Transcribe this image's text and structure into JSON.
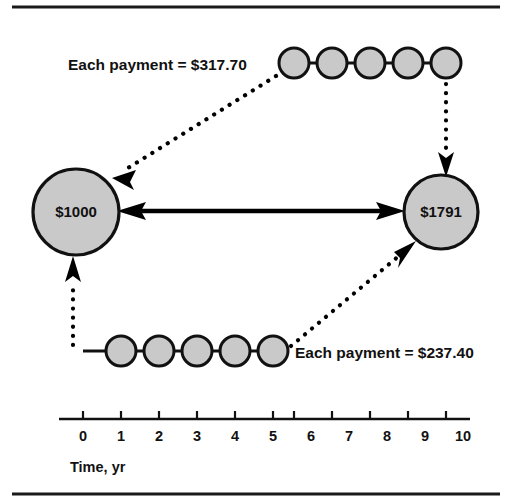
{
  "figure": {
    "background_color": "#ffffff",
    "frame": {
      "top_rule": true,
      "bottom_rule": true,
      "rule_color": "#1a1a1a"
    }
  },
  "nodes": [
    {
      "id": "present-worth",
      "label": "$1000",
      "cx": 76,
      "cy": 212,
      "r": 43,
      "fill": "#c9c9c9",
      "stroke": "#111111"
    },
    {
      "id": "future-worth",
      "label": "$1791",
      "cx": 441,
      "cy": 212,
      "r": 37,
      "fill": "#c9c9c9",
      "stroke": "#111111"
    }
  ],
  "payment_series": [
    {
      "id": "top-series",
      "label": "Each payment = $317.70",
      "amount": "$317.70",
      "years": [
        6,
        7,
        8,
        9,
        10
      ],
      "circle_radius": 15,
      "row_y": 63,
      "label_x": 68,
      "label_y": 70,
      "fill": "#c9c9c9",
      "stroke": "#111111"
    },
    {
      "id": "bottom-series",
      "label": "Each payment = $237.40",
      "amount": "$237.40",
      "years": [
        1,
        2,
        3,
        4,
        5
      ],
      "circle_radius": 15,
      "row_y": 351,
      "label_x": 295,
      "label_y": 358,
      "fill": "#c9c9c9",
      "stroke": "#111111"
    }
  ],
  "connectors": [
    {
      "id": "equivalence-arrow",
      "style": "solid-double-arrow",
      "from": "present-worth",
      "to": "future-worth",
      "color": "#000000"
    },
    {
      "id": "top-series-to-present",
      "style": "dotted-arrow",
      "from": "top-series",
      "to": "present-worth",
      "color": "#000000"
    },
    {
      "id": "top-series-to-future",
      "style": "dotted-arrow",
      "from": "top-series",
      "to": "future-worth",
      "color": "#000000"
    },
    {
      "id": "bottom-series-to-present",
      "style": "dotted-arrow",
      "from": "bottom-series",
      "to": "present-worth",
      "color": "#000000"
    },
    {
      "id": "bottom-series-to-future",
      "style": "dotted-arrow",
      "from": "bottom-series",
      "to": "future-worth",
      "color": "#000000"
    }
  ],
  "axis": {
    "title": "Time, yr",
    "ticks": [
      "0",
      "1",
      "2",
      "3",
      "4",
      "5",
      "6",
      "7",
      "8",
      "9",
      "10"
    ],
    "x_start": 83,
    "x_end": 462,
    "line_y": 419,
    "tick_length": 8,
    "label_y": 441,
    "title_x": 83,
    "title_y": 472,
    "color": "#111111"
  }
}
